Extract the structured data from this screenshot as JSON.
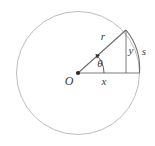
{
  "figure": {
    "background_color": "#ffffff",
    "width": 155,
    "height": 146
  },
  "labels": {
    "radius": "r",
    "opposite": "y",
    "arc": "s",
    "adjacent": "x",
    "origin": "O",
    "angle": "θ"
  },
  "colors": {
    "circle_stroke": "#b5b5b5",
    "line_stroke": "#6b6b6b",
    "arc_stroke": "#6b6b6b",
    "angle_stroke": "#4a4a4a",
    "vertex_fill": "#2b2b2b",
    "text": "#3a3a3a"
  },
  "geometry": {
    "circle": {
      "cx": 78,
      "cy": 73,
      "r": 61.5
    },
    "origin_point": {
      "x": 78,
      "y": 73
    },
    "apex_point": {
      "x": 126,
      "y": 30
    },
    "foot_point": {
      "x": 126,
      "y": 73
    },
    "axis_end": {
      "x": 139.5,
      "y": 73
    },
    "angle_arc_radius": 26
  },
  "label_positions": {
    "radius": {
      "x": 103,
      "y": 40
    },
    "opposite": {
      "x": 130,
      "y": 54
    },
    "arc": {
      "x": 143,
      "y": 55
    },
    "adjacent": {
      "x": 103,
      "y": 85
    },
    "origin": {
      "x": 67,
      "y": 85
    },
    "angle": {
      "x": 99,
      "y": 67
    }
  }
}
